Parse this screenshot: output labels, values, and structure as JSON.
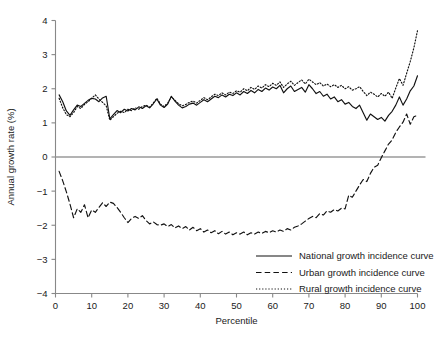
{
  "chart_data": {
    "type": "line",
    "title": "",
    "xlabel": "Percentile",
    "ylabel": "Annual growth rate (%)",
    "xlim": [
      0,
      100
    ],
    "ylim": [
      -4,
      4
    ],
    "xticks": [
      0,
      10,
      20,
      30,
      40,
      50,
      60,
      70,
      80,
      90,
      100
    ],
    "yticks": [
      -4,
      -3,
      -2,
      -1,
      0,
      1,
      2,
      3,
      4
    ],
    "xtick_labels": [
      "0",
      "10",
      "20",
      "30",
      "40",
      "50",
      "60",
      "70",
      "80",
      "90",
      "100"
    ],
    "ytick_labels": [
      "−4",
      "−3",
      "−2",
      "−1",
      "0",
      "1",
      "2",
      "3",
      "4"
    ],
    "grid": false,
    "zero_reference_line": 0,
    "legend_position": "bottom-right",
    "x": [
      1,
      2,
      3,
      4,
      5,
      6,
      7,
      8,
      9,
      10,
      11,
      12,
      13,
      14,
      15,
      16,
      17,
      18,
      19,
      20,
      21,
      22,
      23,
      24,
      25,
      26,
      27,
      28,
      29,
      30,
      31,
      32,
      33,
      34,
      35,
      36,
      37,
      38,
      39,
      40,
      41,
      42,
      43,
      44,
      45,
      46,
      47,
      48,
      49,
      50,
      51,
      52,
      53,
      54,
      55,
      56,
      57,
      58,
      59,
      60,
      61,
      62,
      63,
      64,
      65,
      66,
      67,
      68,
      69,
      70,
      71,
      72,
      73,
      74,
      75,
      76,
      77,
      78,
      79,
      80,
      81,
      82,
      83,
      84,
      85,
      86,
      87,
      88,
      89,
      90,
      91,
      92,
      93,
      94,
      95,
      96,
      97,
      98,
      99,
      100
    ],
    "series": [
      {
        "name": "National growth incidence curve",
        "style": "solid",
        "values": [
          1.82,
          1.62,
          1.35,
          1.22,
          1.38,
          1.52,
          1.48,
          1.57,
          1.66,
          1.72,
          1.7,
          1.62,
          1.73,
          1.78,
          1.12,
          1.24,
          1.36,
          1.3,
          1.4,
          1.35,
          1.42,
          1.38,
          1.47,
          1.42,
          1.5,
          1.44,
          1.56,
          1.7,
          1.52,
          1.45,
          1.55,
          1.78,
          1.64,
          1.52,
          1.44,
          1.48,
          1.55,
          1.58,
          1.52,
          1.6,
          1.68,
          1.62,
          1.7,
          1.78,
          1.74,
          1.82,
          1.76,
          1.84,
          1.8,
          1.88,
          1.82,
          1.92,
          1.86,
          1.95,
          1.88,
          1.98,
          1.92,
          2.02,
          1.96,
          2.05,
          2.0,
          2.1,
          1.88,
          2.0,
          2.08,
          1.92,
          1.98,
          2.04,
          1.9,
          2.12,
          2.0,
          1.86,
          1.92,
          1.78,
          1.84,
          1.7,
          1.76,
          1.62,
          1.68,
          1.55,
          1.6,
          1.48,
          1.42,
          1.52,
          1.3,
          1.08,
          1.26,
          1.18,
          1.1,
          1.16,
          1.05,
          1.22,
          1.34,
          1.52,
          1.76,
          1.52,
          1.7,
          1.94,
          2.08,
          2.38
        ]
      },
      {
        "name": "Urban growth incidence curve",
        "style": "dashed",
        "values": [
          -0.42,
          -0.7,
          -1.02,
          -1.38,
          -1.78,
          -1.52,
          -1.62,
          -1.4,
          -1.78,
          -1.55,
          -1.62,
          -1.48,
          -1.34,
          -1.45,
          -1.32,
          -1.36,
          -1.48,
          -1.62,
          -1.78,
          -1.92,
          -1.8,
          -1.74,
          -1.8,
          -1.72,
          -1.86,
          -1.96,
          -1.9,
          -1.98,
          -2.0,
          -1.96,
          -2.04,
          -1.98,
          -2.08,
          -2.02,
          -2.1,
          -2.04,
          -2.14,
          -2.06,
          -2.16,
          -2.1,
          -2.2,
          -2.14,
          -2.22,
          -2.16,
          -2.25,
          -2.18,
          -2.26,
          -2.2,
          -2.28,
          -2.22,
          -2.26,
          -2.2,
          -2.28,
          -2.22,
          -2.26,
          -2.2,
          -2.24,
          -2.18,
          -2.22,
          -2.16,
          -2.2,
          -2.14,
          -2.18,
          -2.1,
          -2.14,
          -2.06,
          -2.02,
          -1.96,
          -1.88,
          -1.8,
          -1.74,
          -1.78,
          -1.66,
          -1.7,
          -1.58,
          -1.62,
          -1.54,
          -1.58,
          -1.5,
          -1.52,
          -1.12,
          -1.18,
          -1.0,
          -0.82,
          -0.66,
          -0.72,
          -0.48,
          -0.3,
          -0.24,
          -0.02,
          0.18,
          0.38,
          0.5,
          0.72,
          0.88,
          1.02,
          1.26,
          0.96,
          1.18,
          1.22
        ]
      },
      {
        "name": "Rural growth incidence curve",
        "style": "dotted",
        "values": [
          1.72,
          1.44,
          1.24,
          1.18,
          1.3,
          1.48,
          1.42,
          1.54,
          1.62,
          1.72,
          1.82,
          1.7,
          1.6,
          1.5,
          1.08,
          1.18,
          1.28,
          1.34,
          1.3,
          1.4,
          1.36,
          1.44,
          1.4,
          1.48,
          1.52,
          1.46,
          1.58,
          1.72,
          1.55,
          1.48,
          1.58,
          1.76,
          1.66,
          1.56,
          1.5,
          1.54,
          1.6,
          1.64,
          1.58,
          1.66,
          1.74,
          1.68,
          1.76,
          1.84,
          1.8,
          1.88,
          1.82,
          1.9,
          1.86,
          1.94,
          1.9,
          2.0,
          1.94,
          2.04,
          1.98,
          2.08,
          2.02,
          2.12,
          2.06,
          2.16,
          2.1,
          2.2,
          2.04,
          2.14,
          2.22,
          2.1,
          2.18,
          2.26,
          2.14,
          2.28,
          2.2,
          2.12,
          2.18,
          2.08,
          2.14,
          2.06,
          2.12,
          2.04,
          2.1,
          2.0,
          2.06,
          1.96,
          2.0,
          2.06,
          1.92,
          1.8,
          1.9,
          1.84,
          1.76,
          1.86,
          1.78,
          1.9,
          1.72,
          2.02,
          2.3,
          2.1,
          2.45,
          2.8,
          3.2,
          3.7
        ]
      }
    ],
    "legend": [
      {
        "label": "National growth incidence curve",
        "style": "solid"
      },
      {
        "label": "Urban growth incidence curve",
        "style": "dashed"
      },
      {
        "label": "Rural growth incidence curve",
        "style": "dotted"
      }
    ],
    "colors": {
      "line": "#111111",
      "axis": "#888888",
      "zero_line": "#9a9a9a",
      "background": "#ffffff"
    }
  }
}
